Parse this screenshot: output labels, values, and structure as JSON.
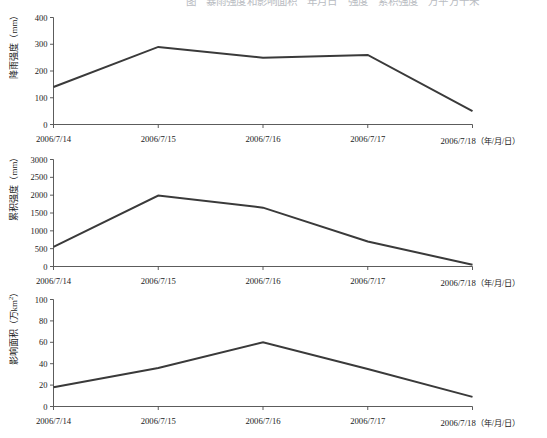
{
  "top_caption": "图　暴雨强度和影响面积　年月日　强度　累积强度　万平方千米",
  "x_axis": {
    "categories": [
      "2006/7/14",
      "2006/7/15",
      "2006/7/16",
      "2006/7/17",
      "2006/7/18"
    ],
    "unit_label": "（年/月/日）"
  },
  "charts": [
    {
      "id": "rain",
      "ylabel_text": "降雨强度（mm）",
      "ylabel_main": "降雨强度（mm）",
      "yticks": [
        "0",
        "100",
        "200",
        "300",
        "400"
      ]
    },
    {
      "id": "accum",
      "ylabel_text": "累积强度（mm）",
      "ylabel_main": "累积强度（mm）",
      "yticks": [
        "0",
        "500",
        "1000",
        "1500",
        "2000",
        "2500",
        "3000"
      ]
    },
    {
      "id": "area",
      "ylabel_text": "影响面积（万km²）",
      "ylabel_main": "影响面积（万km",
      "ylabel_sup": "2",
      "ylabel_tail": "）",
      "yticks": [
        "0",
        "20",
        "40",
        "60",
        "80",
        "100"
      ]
    }
  ],
  "chart_data": [
    {
      "type": "line",
      "title": "",
      "xlabel": "（年/月/日）",
      "ylabel": "降雨强度（mm）",
      "categories": [
        "2006/7/14",
        "2006/7/15",
        "2006/7/16",
        "2006/7/17",
        "2006/7/18"
      ],
      "values": [
        140,
        290,
        250,
        260,
        50
      ],
      "ylim": [
        0,
        400
      ],
      "ytick_step": 100,
      "yticks": [
        0,
        100,
        200,
        300,
        400
      ],
      "grid": false,
      "legend": "none",
      "line_color": "#3a3a3a"
    },
    {
      "type": "line",
      "title": "",
      "xlabel": "（年/月/日）",
      "ylabel": "累积强度（mm）",
      "categories": [
        "2006/7/14",
        "2006/7/15",
        "2006/7/16",
        "2006/7/17",
        "2006/7/18"
      ],
      "values": [
        550,
        1990,
        1650,
        700,
        50
      ],
      "ylim": [
        0,
        3000
      ],
      "ytick_step": 500,
      "yticks": [
        0,
        500,
        1000,
        1500,
        2000,
        2500,
        3000
      ],
      "grid": false,
      "legend": "none",
      "line_color": "#3a3a3a"
    },
    {
      "type": "line",
      "title": "",
      "xlabel": "（年/月/日）",
      "ylabel": "影响面积（万km²）",
      "categories": [
        "2006/7/14",
        "2006/7/15",
        "2006/7/16",
        "2006/7/17",
        "2006/7/18"
      ],
      "values": [
        18,
        36,
        60,
        35,
        9
      ],
      "ylim": [
        0,
        100
      ],
      "ytick_step": 20,
      "yticks": [
        0,
        20,
        40,
        60,
        80,
        100
      ],
      "grid": false,
      "legend": "none",
      "line_color": "#3a3a3a"
    }
  ]
}
